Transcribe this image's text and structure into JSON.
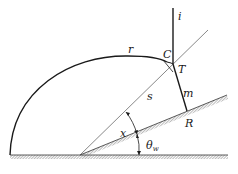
{
  "diagram": {
    "type": "geometry",
    "labels": {
      "r": "r",
      "C": "C",
      "T": "T",
      "i": "i",
      "s": "s",
      "m": "m",
      "R": "R",
      "x": "x",
      "theta": "θ",
      "theta_sub": "w"
    },
    "colors": {
      "line": "#1a1a1a",
      "thin_line": "#555555",
      "hatch": "#777777",
      "background": "#ffffff"
    }
  }
}
